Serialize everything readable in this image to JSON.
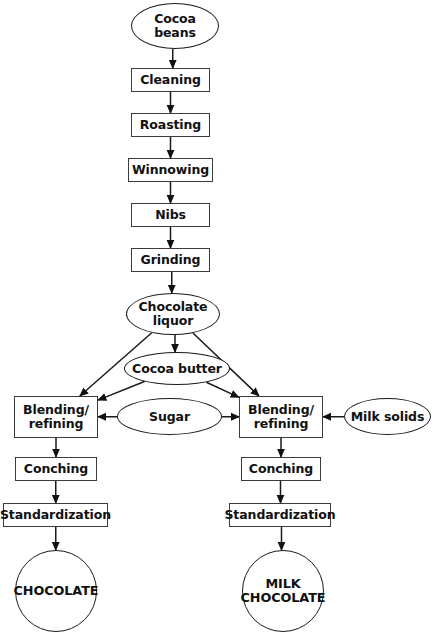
{
  "diagram": {
    "background_color": "#ffffff",
    "line_color": "#1a1a1a",
    "box_border_color": "#3b3b3b",
    "text_color": "#111111",
    "nodes": [
      {
        "id": "cocoa-beans",
        "label": "Cocoa\nbeans",
        "shape": "ellipse",
        "x": 131,
        "y": 3,
        "w": 88,
        "h": 46
      },
      {
        "id": "cleaning",
        "label": "Cleaning",
        "shape": "process",
        "x": 131,
        "y": 68,
        "w": 79,
        "h": 24
      },
      {
        "id": "roasting",
        "label": "Roasting",
        "shape": "process",
        "x": 131,
        "y": 113,
        "w": 79,
        "h": 24
      },
      {
        "id": "winnowing",
        "label": "Winnowing",
        "shape": "process",
        "x": 128,
        "y": 158,
        "w": 85,
        "h": 24
      },
      {
        "id": "nibs",
        "label": "Nibs",
        "shape": "process",
        "x": 131,
        "y": 203,
        "w": 79,
        "h": 24
      },
      {
        "id": "grinding",
        "label": "Grinding",
        "shape": "process",
        "x": 131,
        "y": 248,
        "w": 79,
        "h": 24
      },
      {
        "id": "chocolate-liquor",
        "label": "Chocolate\nliquor",
        "shape": "ellipse",
        "x": 126,
        "y": 293,
        "w": 94,
        "h": 42
      },
      {
        "id": "cocoa-butter",
        "label": "Cocoa butter",
        "shape": "ellipse",
        "x": 124,
        "y": 352,
        "w": 106,
        "h": 33
      },
      {
        "id": "blending-dark",
        "label": "Blending/\nrefining",
        "shape": "process",
        "x": 14,
        "y": 396,
        "w": 84,
        "h": 42
      },
      {
        "id": "sugar",
        "label": "Sugar",
        "shape": "ellipse",
        "x": 117,
        "y": 398,
        "w": 105,
        "h": 37
      },
      {
        "id": "blending-milk",
        "label": "Blending/\nrefining",
        "shape": "process",
        "x": 239,
        "y": 396,
        "w": 84,
        "h": 42
      },
      {
        "id": "milk-solids",
        "label": "Milk solids",
        "shape": "ellipse",
        "x": 344,
        "y": 398,
        "w": 87,
        "h": 37
      },
      {
        "id": "conching-dark",
        "label": "Conching",
        "shape": "process",
        "x": 15,
        "y": 457,
        "w": 82,
        "h": 24
      },
      {
        "id": "conching-milk",
        "label": "Conching",
        "shape": "process",
        "x": 241,
        "y": 457,
        "w": 80,
        "h": 24
      },
      {
        "id": "standardization-dark",
        "label": "Standardization",
        "shape": "process",
        "x": 3,
        "y": 503,
        "w": 105,
        "h": 24
      },
      {
        "id": "standardization-milk",
        "label": "Standardization",
        "shape": "process",
        "x": 229,
        "y": 503,
        "w": 102,
        "h": 24
      },
      {
        "id": "chocolate",
        "label": "CHOCOLATE",
        "shape": "circle",
        "x": 15,
        "y": 550,
        "w": 82,
        "h": 82
      },
      {
        "id": "milk-chocolate",
        "label": "MILK\nCHOCOLATE",
        "shape": "circle",
        "x": 242,
        "y": 550,
        "w": 82,
        "h": 82
      }
    ],
    "edges": [
      {
        "id": "e-beans-cleaning",
        "from": "cocoa-beans",
        "to": "cleaning",
        "type": "vertical"
      },
      {
        "id": "e-cleaning-roasting",
        "from": "cleaning",
        "to": "roasting",
        "type": "vertical"
      },
      {
        "id": "e-roasting-winnowing",
        "from": "roasting",
        "to": "winnowing",
        "type": "vertical"
      },
      {
        "id": "e-winnowing-nibs",
        "from": "winnowing",
        "to": "nibs",
        "type": "vertical"
      },
      {
        "id": "e-nibs-grinding",
        "from": "nibs",
        "to": "grinding",
        "type": "vertical"
      },
      {
        "id": "e-grinding-liquor",
        "from": "grinding",
        "to": "chocolate-liquor",
        "type": "vertical"
      },
      {
        "id": "e-liquor-butter",
        "from": "chocolate-liquor",
        "to": "cocoa-butter",
        "type": "vertical"
      },
      {
        "id": "e-liquor-blend-dark",
        "from": "chocolate-liquor",
        "to": "blending-dark",
        "type": "diagonal"
      },
      {
        "id": "e-liquor-blend-milk",
        "from": "chocolate-liquor",
        "to": "blending-milk",
        "type": "diagonal"
      },
      {
        "id": "e-butter-blend-dark",
        "from": "cocoa-butter",
        "to": "blending-dark",
        "type": "diagonal"
      },
      {
        "id": "e-butter-blend-milk",
        "from": "cocoa-butter",
        "to": "blending-milk",
        "type": "diagonal"
      },
      {
        "id": "e-sugar-blend-dark",
        "from": "sugar",
        "to": "blending-dark",
        "type": "horizontal-left"
      },
      {
        "id": "e-sugar-blend-milk",
        "from": "sugar",
        "to": "blending-milk",
        "type": "horizontal-right"
      },
      {
        "id": "e-milk-blend-milk",
        "from": "milk-solids",
        "to": "blending-milk",
        "type": "horizontal-left"
      },
      {
        "id": "e-blend-conch-dark",
        "from": "blending-dark",
        "to": "conching-dark",
        "type": "vertical"
      },
      {
        "id": "e-blend-conch-milk",
        "from": "blending-milk",
        "to": "conching-milk",
        "type": "vertical"
      },
      {
        "id": "e-conch-std-dark",
        "from": "conching-dark",
        "to": "standardization-dark",
        "type": "vertical"
      },
      {
        "id": "e-conch-std-milk",
        "from": "conching-milk",
        "to": "standardization-milk",
        "type": "vertical"
      },
      {
        "id": "e-std-chocolate",
        "from": "standardization-dark",
        "to": "chocolate",
        "type": "vertical"
      },
      {
        "id": "e-std-milk-chocolate",
        "from": "standardization-milk",
        "to": "milk-chocolate",
        "type": "vertical"
      }
    ]
  }
}
